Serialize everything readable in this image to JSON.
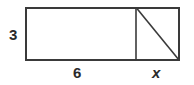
{
  "figure": {
    "type": "geometry-diagram",
    "canvas": {
      "width": 194,
      "height": 85,
      "background": "#ffffff"
    },
    "stroke_color": "#3a3a3a",
    "label_color": "#2b2b2b",
    "shapes": {
      "outer_rectangle": {
        "name": "outer-rectangle",
        "x": 25,
        "y": 7,
        "width": 155,
        "height": 54,
        "stroke_width": 2
      },
      "vertical_divider": {
        "name": "vertical-divider",
        "x1": 136,
        "y1": 7,
        "x2": 136,
        "y2": 61,
        "stroke_width": 1.5
      },
      "diagonal": {
        "name": "triangle-hypotenuse",
        "x1": 136,
        "y1": 7,
        "x2": 180,
        "y2": 61,
        "stroke_width": 1.5
      }
    },
    "labels": {
      "height": "3",
      "width_left": "6",
      "width_right": "x"
    }
  }
}
